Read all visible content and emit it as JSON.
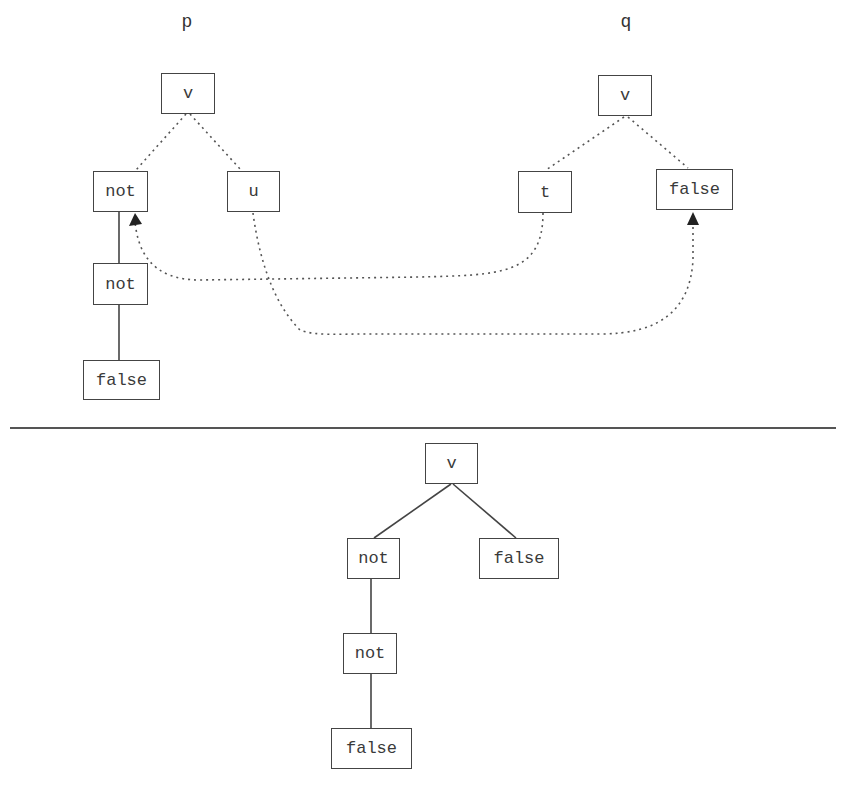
{
  "top": {
    "left_tree": {
      "name": "p",
      "root": "v",
      "children": [
        "not",
        "u"
      ],
      "chain": [
        "not",
        "not",
        "false"
      ]
    },
    "right_tree": {
      "name": "q",
      "root": "v",
      "children": [
        "t",
        "false"
      ]
    },
    "links": [
      {
        "from": "t",
        "to": "not",
        "style": "dotted-arrow"
      },
      {
        "from": "u",
        "to": "false",
        "style": "dotted-arrow"
      }
    ]
  },
  "bottom": {
    "result_tree": {
      "root": "v",
      "children": [
        "not",
        "false"
      ],
      "chain": [
        "not",
        "not",
        "false"
      ]
    }
  },
  "colors": {
    "stroke": "#444444",
    "text": "#333333",
    "background": "#ffffff"
  }
}
